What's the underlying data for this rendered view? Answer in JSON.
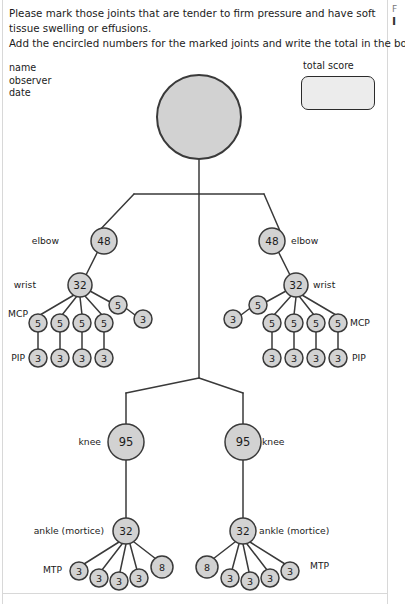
{
  "instructions": {
    "line1": "Please mark those joints that are tender to firm pressure and have soft",
    "line2": "tissue swelling or effusions.",
    "line3": "Add the encircled numbers for the marked joints and write the total in the box."
  },
  "sidebar_sliver": {
    "top_char": "F",
    "bottom_char": "I"
  },
  "fields": {
    "name": "name",
    "observer": "observer",
    "date": "date"
  },
  "total_score": {
    "label": "total score",
    "value": ""
  },
  "colors": {
    "node_fill": "#d2d2d2",
    "node_stroke": "#3a3a3a",
    "line": "#3a3a3a",
    "text": "#1b1b1b",
    "box_fill": "#ececec"
  },
  "figure": {
    "head": {
      "value": "",
      "cx": 199,
      "cy": 117,
      "r": 42
    },
    "labels": [
      {
        "name": "elbow-left",
        "text": "elbow",
        "x": 59,
        "y": 241,
        "align": "right"
      },
      {
        "name": "elbow-right",
        "text": "elbow",
        "x": 291,
        "y": 241,
        "align": "left"
      },
      {
        "name": "wrist-left",
        "text": "wrist",
        "x": 36,
        "y": 285,
        "align": "right"
      },
      {
        "name": "wrist-right",
        "text": "wrist",
        "x": 313,
        "y": 285,
        "align": "left"
      },
      {
        "name": "mcp-left",
        "text": "MCP",
        "x": 28,
        "y": 314,
        "align": "right"
      },
      {
        "name": "mcp-right",
        "text": "MCP",
        "x": 350,
        "y": 323,
        "align": "left"
      },
      {
        "name": "pip-left",
        "text": "PIP",
        "x": 25,
        "y": 358,
        "align": "right"
      },
      {
        "name": "pip-right",
        "text": "PIP",
        "x": 352,
        "y": 358,
        "align": "left"
      },
      {
        "name": "knee-left",
        "text": "knee",
        "x": 101,
        "y": 442,
        "align": "right"
      },
      {
        "name": "knee-right",
        "text": "knee",
        "x": 262,
        "y": 442,
        "align": "left"
      },
      {
        "name": "ankle-left",
        "text": "ankle (mortice)",
        "x": 104,
        "y": 531,
        "align": "right"
      },
      {
        "name": "ankle-right",
        "text": "ankle (mortice)",
        "x": 259,
        "y": 531,
        "align": "left"
      },
      {
        "name": "mtp-left",
        "text": "MTP",
        "x": 62,
        "y": 570,
        "align": "right"
      },
      {
        "name": "mtp-right",
        "text": "MTP",
        "x": 310,
        "y": 566,
        "align": "left"
      }
    ],
    "nodes": [
      {
        "name": "elbow-left",
        "value": "48",
        "cx": 104,
        "cy": 241,
        "r": 13
      },
      {
        "name": "elbow-right",
        "value": "48",
        "cx": 272,
        "cy": 241,
        "r": 13
      },
      {
        "name": "wrist-left",
        "value": "32",
        "cx": 80,
        "cy": 285,
        "r": 12
      },
      {
        "name": "wrist-right",
        "value": "32",
        "cx": 296,
        "cy": 285,
        "r": 12
      },
      {
        "name": "mcp-left-1",
        "value": "5",
        "cx": 38,
        "cy": 323,
        "r": 9
      },
      {
        "name": "mcp-left-2",
        "value": "5",
        "cx": 60,
        "cy": 323,
        "r": 9
      },
      {
        "name": "mcp-left-3",
        "value": "5",
        "cx": 82,
        "cy": 323,
        "r": 9
      },
      {
        "name": "mcp-left-4",
        "value": "5",
        "cx": 104,
        "cy": 323,
        "r": 9
      },
      {
        "name": "mcp-left-thumb",
        "value": "5",
        "cx": 118,
        "cy": 305,
        "r": 9
      },
      {
        "name": "ip-left-thumb",
        "value": "3",
        "cx": 143,
        "cy": 319,
        "r": 9
      },
      {
        "name": "pip-left-1",
        "value": "3",
        "cx": 38,
        "cy": 358,
        "r": 9
      },
      {
        "name": "pip-left-2",
        "value": "3",
        "cx": 60,
        "cy": 358,
        "r": 9
      },
      {
        "name": "pip-left-3",
        "value": "3",
        "cx": 82,
        "cy": 358,
        "r": 9
      },
      {
        "name": "pip-left-4",
        "value": "3",
        "cx": 104,
        "cy": 358,
        "r": 9
      },
      {
        "name": "mcp-right-1",
        "value": "5",
        "cx": 338,
        "cy": 323,
        "r": 9
      },
      {
        "name": "mcp-right-2",
        "value": "5",
        "cx": 316,
        "cy": 323,
        "r": 9
      },
      {
        "name": "mcp-right-3",
        "value": "5",
        "cx": 294,
        "cy": 323,
        "r": 9
      },
      {
        "name": "mcp-right-4",
        "value": "5",
        "cx": 272,
        "cy": 323,
        "r": 9
      },
      {
        "name": "mcp-right-thumb",
        "value": "5",
        "cx": 258,
        "cy": 305,
        "r": 9
      },
      {
        "name": "ip-right-thumb",
        "value": "3",
        "cx": 233,
        "cy": 319,
        "r": 9
      },
      {
        "name": "pip-right-1",
        "value": "3",
        "cx": 338,
        "cy": 358,
        "r": 9
      },
      {
        "name": "pip-right-2",
        "value": "3",
        "cx": 316,
        "cy": 358,
        "r": 9
      },
      {
        "name": "pip-right-3",
        "value": "3",
        "cx": 294,
        "cy": 358,
        "r": 9
      },
      {
        "name": "pip-right-4",
        "value": "3",
        "cx": 272,
        "cy": 358,
        "r": 9
      },
      {
        "name": "knee-left",
        "value": "95",
        "cx": 126,
        "cy": 442,
        "r": 18
      },
      {
        "name": "knee-right",
        "value": "95",
        "cx": 243,
        "cy": 442,
        "r": 18
      },
      {
        "name": "ankle-left",
        "value": "32",
        "cx": 126,
        "cy": 531,
        "r": 13
      },
      {
        "name": "ankle-right",
        "value": "32",
        "cx": 243,
        "cy": 531,
        "r": 13
      },
      {
        "name": "mtp-left-1",
        "value": "3",
        "cx": 79,
        "cy": 571,
        "r": 9
      },
      {
        "name": "mtp-left-2",
        "value": "3",
        "cx": 99,
        "cy": 578,
        "r": 9
      },
      {
        "name": "mtp-left-3",
        "value": "3",
        "cx": 119,
        "cy": 581,
        "r": 9
      },
      {
        "name": "mtp-left-4",
        "value": "3",
        "cx": 139,
        "cy": 578,
        "r": 9
      },
      {
        "name": "mtp-left-5",
        "value": "8",
        "cx": 162,
        "cy": 567,
        "r": 11
      },
      {
        "name": "mtp-right-1",
        "value": "3",
        "cx": 290,
        "cy": 571,
        "r": 9
      },
      {
        "name": "mtp-right-2",
        "value": "3",
        "cx": 270,
        "cy": 578,
        "r": 9
      },
      {
        "name": "mtp-right-3",
        "value": "3",
        "cx": 250,
        "cy": 581,
        "r": 9
      },
      {
        "name": "mtp-right-4",
        "value": "3",
        "cx": 230,
        "cy": 578,
        "r": 9
      },
      {
        "name": "mtp-right-5",
        "value": "8",
        "cx": 207,
        "cy": 567,
        "r": 11
      }
    ],
    "edges": [
      {
        "name": "head-to-trunk",
        "x1": 199,
        "y1": 159,
        "x2": 199,
        "y2": 194
      },
      {
        "name": "shoulder-bar",
        "x1": 134,
        "y1": 194,
        "x2": 264,
        "y2": 194
      },
      {
        "name": "trunk",
        "x1": 199,
        "y1": 194,
        "x2": 199,
        "y2": 378
      },
      {
        "name": "shoulder-to-elbow-left",
        "x1": 134,
        "y1": 194,
        "x2": 96,
        "y2": 234
      },
      {
        "name": "shoulder-to-elbow-right",
        "x1": 264,
        "y1": 194,
        "x2": 280,
        "y2": 231
      },
      {
        "name": "elbow-to-wrist-left",
        "x1": 98,
        "y1": 251,
        "x2": 86,
        "y2": 275
      },
      {
        "name": "elbow-to-wrist-right",
        "x1": 278,
        "y1": 251,
        "x2": 290,
        "y2": 275
      },
      {
        "name": "wrist-to-mcp-left-1",
        "x1": 74,
        "y1": 295,
        "x2": 40,
        "y2": 315
      },
      {
        "name": "wrist-to-mcp-left-2",
        "x1": 77,
        "y1": 296,
        "x2": 62,
        "y2": 315
      },
      {
        "name": "wrist-to-mcp-left-3",
        "x1": 80,
        "y1": 297,
        "x2": 82,
        "y2": 315
      },
      {
        "name": "wrist-to-mcp-left-4",
        "x1": 85,
        "y1": 296,
        "x2": 102,
        "y2": 315
      },
      {
        "name": "wrist-to-thumb-left",
        "x1": 90,
        "y1": 291,
        "x2": 110,
        "y2": 302
      },
      {
        "name": "thumb-to-ip-left",
        "x1": 127,
        "y1": 309,
        "x2": 135,
        "y2": 315
      },
      {
        "name": "mcp-to-pip-left-1",
        "x1": 38,
        "y1": 332,
        "x2": 38,
        "y2": 349
      },
      {
        "name": "mcp-to-pip-left-2",
        "x1": 60,
        "y1": 332,
        "x2": 60,
        "y2": 349
      },
      {
        "name": "mcp-to-pip-left-3",
        "x1": 82,
        "y1": 332,
        "x2": 82,
        "y2": 349
      },
      {
        "name": "mcp-to-pip-left-4",
        "x1": 104,
        "y1": 332,
        "x2": 104,
        "y2": 349
      },
      {
        "name": "wrist-to-mcp-right-1",
        "x1": 302,
        "y1": 295,
        "x2": 336,
        "y2": 315
      },
      {
        "name": "wrist-to-mcp-right-2",
        "x1": 299,
        "y1": 296,
        "x2": 314,
        "y2": 315
      },
      {
        "name": "wrist-to-mcp-right-3",
        "x1": 296,
        "y1": 297,
        "x2": 294,
        "y2": 315
      },
      {
        "name": "wrist-to-mcp-right-4",
        "x1": 291,
        "y1": 296,
        "x2": 274,
        "y2": 315
      },
      {
        "name": "wrist-to-thumb-right",
        "x1": 286,
        "y1": 291,
        "x2": 266,
        "y2": 302
      },
      {
        "name": "thumb-to-ip-right",
        "x1": 249,
        "y1": 309,
        "x2": 241,
        "y2": 315
      },
      {
        "name": "mcp-to-pip-right-1",
        "x1": 338,
        "y1": 332,
        "x2": 338,
        "y2": 349
      },
      {
        "name": "mcp-to-pip-right-2",
        "x1": 316,
        "y1": 332,
        "x2": 316,
        "y2": 349
      },
      {
        "name": "mcp-to-pip-right-3",
        "x1": 294,
        "y1": 332,
        "x2": 294,
        "y2": 349
      },
      {
        "name": "mcp-to-pip-right-4",
        "x1": 272,
        "y1": 332,
        "x2": 272,
        "y2": 349
      },
      {
        "name": "hip-left-diagonal",
        "x1": 199,
        "y1": 378,
        "x2": 126,
        "y2": 393
      },
      {
        "name": "hip-right-diagonal",
        "x1": 199,
        "y1": 378,
        "x2": 243,
        "y2": 393
      },
      {
        "name": "thigh-left",
        "x1": 126,
        "y1": 393,
        "x2": 126,
        "y2": 424
      },
      {
        "name": "thigh-right",
        "x1": 243,
        "y1": 393,
        "x2": 243,
        "y2": 424
      },
      {
        "name": "shin-left",
        "x1": 126,
        "y1": 460,
        "x2": 126,
        "y2": 518
      },
      {
        "name": "shin-right",
        "x1": 243,
        "y1": 460,
        "x2": 243,
        "y2": 518
      },
      {
        "name": "ankle-to-mtp-left-1",
        "x1": 119,
        "y1": 542,
        "x2": 84,
        "y2": 564
      },
      {
        "name": "ankle-to-mtp-left-2",
        "x1": 122,
        "y1": 544,
        "x2": 102,
        "y2": 570
      },
      {
        "name": "ankle-to-mtp-left-3",
        "x1": 126,
        "y1": 544,
        "x2": 120,
        "y2": 572
      },
      {
        "name": "ankle-to-mtp-left-4",
        "x1": 130,
        "y1": 544,
        "x2": 137,
        "y2": 570
      },
      {
        "name": "ankle-to-mtp-left-5",
        "x1": 134,
        "y1": 542,
        "x2": 156,
        "y2": 559
      },
      {
        "name": "ankle-to-mtp-right-1",
        "x1": 250,
        "y1": 542,
        "x2": 285,
        "y2": 564
      },
      {
        "name": "ankle-to-mtp-right-2",
        "x1": 247,
        "y1": 544,
        "x2": 267,
        "y2": 570
      },
      {
        "name": "ankle-to-mtp-right-3",
        "x1": 243,
        "y1": 544,
        "x2": 249,
        "y2": 572
      },
      {
        "name": "ankle-to-mtp-right-4",
        "x1": 239,
        "y1": 544,
        "x2": 232,
        "y2": 570
      },
      {
        "name": "ankle-to-mtp-right-5",
        "x1": 235,
        "y1": 542,
        "x2": 213,
        "y2": 559
      }
    ]
  }
}
